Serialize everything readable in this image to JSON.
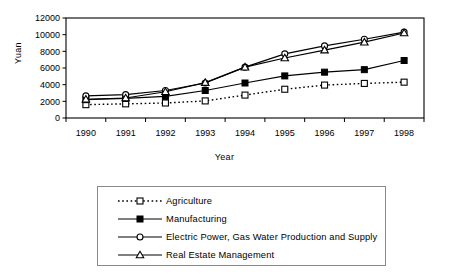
{
  "chart_data": {
    "type": "line",
    "title": "",
    "xlabel": "Year",
    "ylabel": "Yuan",
    "categories": [
      "1990",
      "1991",
      "1992",
      "1993",
      "1994",
      "1995",
      "1996",
      "1997",
      "1998"
    ],
    "x": [
      1990,
      1991,
      1992,
      1993,
      1994,
      1995,
      1996,
      1997,
      1998
    ],
    "xlim": [
      1990,
      1998
    ],
    "ylim": [
      0,
      12000
    ],
    "yticks": [
      "0",
      "2000",
      "4000",
      "6000",
      "8000",
      "10000",
      "12000"
    ],
    "ytick_values": [
      0,
      2000,
      4000,
      6000,
      8000,
      10000,
      12000
    ],
    "grid": false,
    "legend_position": "below",
    "series": [
      {
        "name": "Agriculture",
        "marker": "open-square",
        "line": "dotted",
        "values": [
          1600,
          1700,
          1800,
          2050,
          2750,
          3450,
          3950,
          4150,
          4300
        ]
      },
      {
        "name": "Manufacturing",
        "marker": "filled-square",
        "line": "solid",
        "values": [
          2200,
          2350,
          2600,
          3300,
          4200,
          5050,
          5500,
          5800,
          6900
        ]
      },
      {
        "name": "Electric Power, Gas Water Production and Supply",
        "marker": "open-circle",
        "line": "solid",
        "values": [
          2650,
          2800,
          3300,
          4200,
          6100,
          7700,
          8650,
          9450,
          10300
        ]
      },
      {
        "name": "Real Estate Management",
        "marker": "open-triangle",
        "line": "solid",
        "values": [
          2250,
          2400,
          3150,
          4250,
          6100,
          7200,
          8150,
          9100,
          10200
        ]
      }
    ]
  },
  "legend": {
    "items": [
      {
        "label": "Agriculture",
        "marker": "open-square-icon",
        "line": "dotted"
      },
      {
        "label": "Manufacturing",
        "marker": "filled-square-icon",
        "line": "solid"
      },
      {
        "label": "Electric Power, Gas Water Production and Supply",
        "marker": "open-circle-icon",
        "line": "solid"
      },
      {
        "label": "Real Estate Management",
        "marker": "open-triangle-icon",
        "line": "solid"
      }
    ]
  },
  "colors": {
    "line": "#000000",
    "frame": "#000000",
    "legend_border": "#8a8a8a",
    "background": "#ffffff"
  }
}
